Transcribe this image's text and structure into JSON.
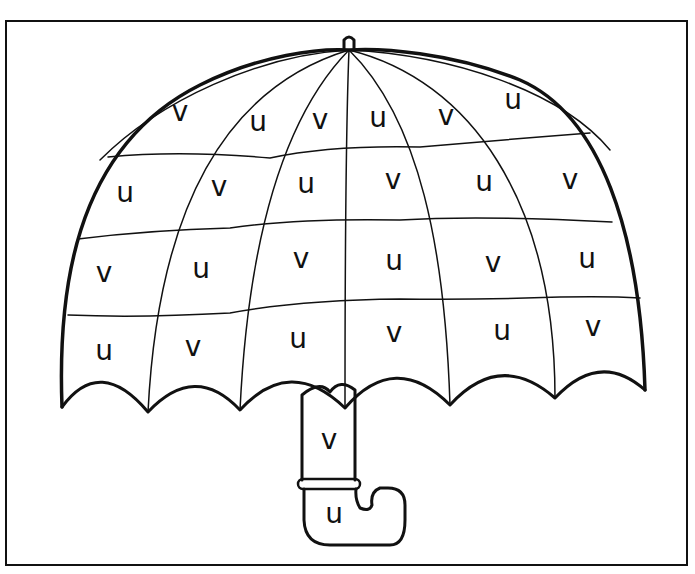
{
  "worksheet": {
    "title": "Umbrella letter sort",
    "colors": {
      "ink": "#111111",
      "paper": "#ffffff"
    },
    "canopy_rows": [
      {
        "row": 1,
        "letters": [
          {
            "ch": "v",
            "x": 180,
            "y": 112
          },
          {
            "ch": "u",
            "x": 258,
            "y": 122
          },
          {
            "ch": "v",
            "x": 320,
            "y": 120
          },
          {
            "ch": "u",
            "x": 378,
            "y": 118
          },
          {
            "ch": "v",
            "x": 446,
            "y": 116
          },
          {
            "ch": "u",
            "x": 513,
            "y": 100
          }
        ]
      },
      {
        "row": 2,
        "letters": [
          {
            "ch": "u",
            "x": 125,
            "y": 193
          },
          {
            "ch": "v",
            "x": 219,
            "y": 187
          },
          {
            "ch": "u",
            "x": 306,
            "y": 184
          },
          {
            "ch": "v",
            "x": 393,
            "y": 180
          },
          {
            "ch": "u",
            "x": 484,
            "y": 182
          },
          {
            "ch": "v",
            "x": 570,
            "y": 180
          }
        ]
      },
      {
        "row": 3,
        "letters": [
          {
            "ch": "v",
            "x": 104,
            "y": 273
          },
          {
            "ch": "u",
            "x": 201,
            "y": 269
          },
          {
            "ch": "v",
            "x": 301,
            "y": 259
          },
          {
            "ch": "u",
            "x": 394,
            "y": 261
          },
          {
            "ch": "v",
            "x": 493,
            "y": 263
          },
          {
            "ch": "u",
            "x": 587,
            "y": 259
          }
        ]
      },
      {
        "row": 4,
        "letters": [
          {
            "ch": "u",
            "x": 104,
            "y": 351
          },
          {
            "ch": "v",
            "x": 193,
            "y": 347
          },
          {
            "ch": "u",
            "x": 298,
            "y": 339
          },
          {
            "ch": "v",
            "x": 394,
            "y": 333
          },
          {
            "ch": "u",
            "x": 502,
            "y": 331
          },
          {
            "ch": "v",
            "x": 593,
            "y": 327
          }
        ]
      }
    ],
    "handle": [
      {
        "ch": "v",
        "x": 329,
        "y": 440
      },
      {
        "ch": "u",
        "x": 334,
        "y": 514
      }
    ]
  }
}
